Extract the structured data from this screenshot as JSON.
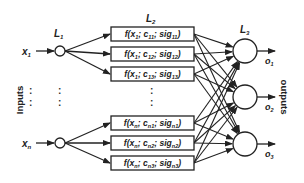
{
  "layers": {
    "l1": {
      "base": "L",
      "sub": "1"
    },
    "l2": {
      "base": "L",
      "sub": "2"
    },
    "l3": {
      "base": "L",
      "sub": "3"
    }
  },
  "inputs_label": "Inputs",
  "outputs_label": "outputs",
  "inputs": [
    {
      "base": "x",
      "sub": "1"
    },
    {
      "base": "x",
      "sub": "n"
    }
  ],
  "outputs": [
    {
      "base": "o",
      "sub": "1"
    },
    {
      "base": "o",
      "sub": "2"
    },
    {
      "base": "o",
      "sub": "3"
    }
  ],
  "boxes": [
    {
      "x": "1",
      "c": "11",
      "sig": "11"
    },
    {
      "x": "1",
      "c": "12",
      "sig": "12"
    },
    {
      "x": "1",
      "c": "13",
      "sig": "13"
    },
    {
      "x": "n",
      "c": "n1",
      "sig": "n1"
    },
    {
      "x": "n",
      "c": "n2",
      "sig": "n2"
    },
    {
      "x": "n",
      "c": "n3",
      "sig": "n3"
    }
  ],
  "ellipsis": ":",
  "colors": {
    "stroke": "#222222",
    "background": "#ffffff"
  }
}
